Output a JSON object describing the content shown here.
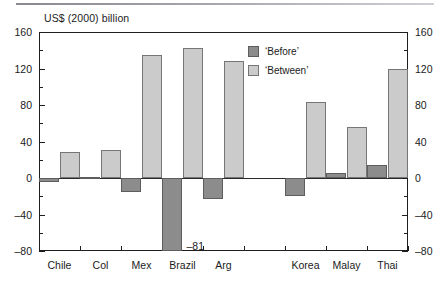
{
  "figure": {
    "title": "US$ (2000) billion",
    "annotation": "–81"
  },
  "legend": {
    "items": [
      {
        "key": "before",
        "label": "‘Before’",
        "color": "#8c8c8c"
      },
      {
        "key": "between",
        "label": "‘Between’",
        "color": "#cbcbcb"
      }
    ]
  },
  "axes": {
    "y_ticks_major": [
      "160",
      "120",
      "80",
      "40",
      "0",
      "–40",
      "–80"
    ],
    "y_ticks_minor": [
      "140",
      "100",
      "60",
      "20",
      "–20",
      "–60"
    ]
  },
  "chart_data": {
    "type": "bar",
    "title": "US$ (2000) billion",
    "xlabel": "",
    "ylabel": "US$ (2000) billion",
    "ylim": [
      -80,
      160
    ],
    "ytick_step": 40,
    "yminor_step": 20,
    "grid": false,
    "legend_position": "inside-top-right",
    "categories": [
      "Chile",
      "Col",
      "Mex",
      "Brazil",
      "Arg",
      "",
      "Korea",
      "Malay",
      "Thai"
    ],
    "series": [
      {
        "name": "‘Before’",
        "color": "#8c8c8c",
        "values": [
          -4,
          1,
          -15,
          -81,
          -23,
          null,
          -20,
          5,
          14
        ]
      },
      {
        "name": "‘Between’",
        "color": "#cbcbcb",
        "values": [
          28,
          31,
          135,
          143,
          128,
          null,
          83,
          56,
          120
        ]
      }
    ],
    "annotations": [
      {
        "text": "–81",
        "series": "‘Before’",
        "category": "Brazil",
        "value": -81
      }
    ]
  }
}
